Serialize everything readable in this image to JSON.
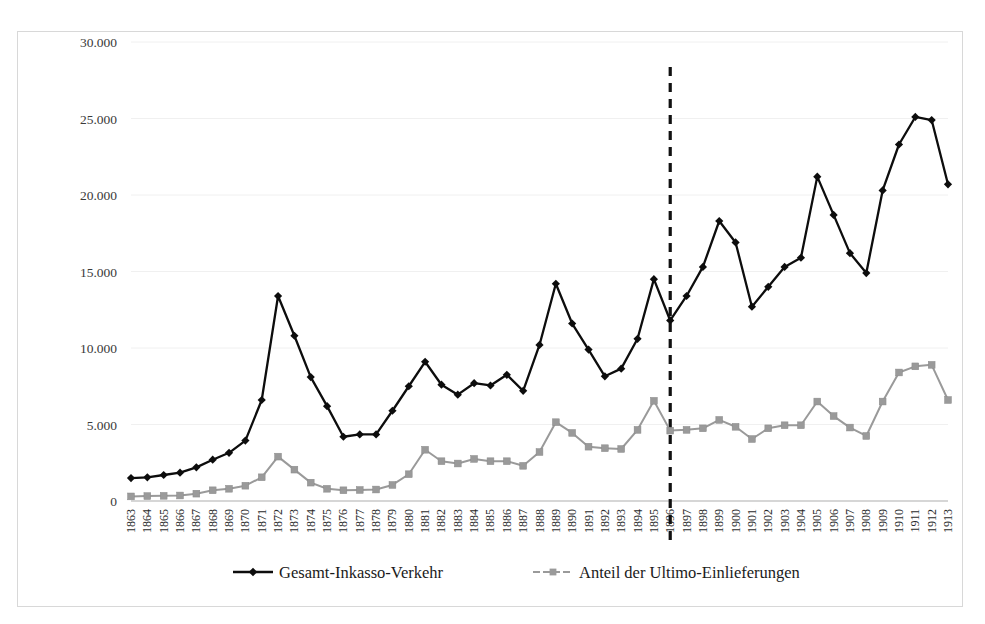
{
  "chart_data": {
    "type": "line",
    "title": "",
    "xlabel": "",
    "ylabel": "",
    "ylim": [
      0,
      30000
    ],
    "yticks": [
      0,
      5000,
      10000,
      15000,
      20000,
      25000,
      30000
    ],
    "ytick_labels": [
      "0",
      "5.000",
      "10.000",
      "15.000",
      "20.000",
      "25.000",
      "30.000"
    ],
    "grid": true,
    "legend_position": "bottom",
    "x": [
      1863,
      1864,
      1865,
      1866,
      1867,
      1868,
      1869,
      1870,
      1871,
      1872,
      1873,
      1874,
      1875,
      1876,
      1877,
      1878,
      1879,
      1880,
      1881,
      1882,
      1883,
      1884,
      1885,
      1886,
      1887,
      1888,
      1889,
      1890,
      1891,
      1892,
      1893,
      1894,
      1895,
      1896,
      1897,
      1898,
      1899,
      1900,
      1901,
      1902,
      1903,
      1904,
      1905,
      1906,
      1907,
      1908,
      1909,
      1910,
      1911,
      1912,
      1913
    ],
    "xtick_labels": [
      "1863",
      "1864",
      "1865",
      "1866",
      "1867",
      "1868",
      "1869",
      "1870",
      "1871",
      "1872",
      "1873",
      "1874",
      "1875",
      "1876",
      "1877",
      "1878",
      "1879",
      "1880",
      "1881",
      "1882",
      "1883",
      "1884",
      "1885",
      "1886",
      "1887",
      "1888",
      "1889",
      "1890",
      "1891",
      "1892",
      "1893",
      "1894",
      "1895",
      "1896",
      "1897",
      "1898",
      "1899",
      "1900",
      "1901",
      "1902",
      "1903",
      "1904",
      "1905",
      "1906",
      "1907",
      "1908",
      "1909",
      "1910",
      "1911",
      "1912",
      "1913"
    ],
    "series": [
      {
        "name": "Gesamt-Inkasso-Verkehr",
        "color": "#0d0d0d",
        "marker": "diamond",
        "values": [
          1500,
          1550,
          1700,
          1850,
          2200,
          2700,
          3150,
          3950,
          6600,
          13400,
          10800,
          8100,
          6200,
          4200,
          4350,
          4350,
          5900,
          7500,
          9100,
          7600,
          6950,
          7700,
          7550,
          8250,
          7200,
          10200,
          14200,
          11600,
          9900,
          8150,
          8650,
          10600,
          14500,
          11800,
          13400,
          15300,
          18300,
          16900,
          12700,
          14000,
          15300,
          15900,
          21200,
          18700,
          16200,
          14900,
          20300,
          23300,
          25100,
          24900,
          20700
        ]
      },
      {
        "name": "Anteil der Ultimo-Einlieferungen",
        "color": "#9a9a9a",
        "marker": "square",
        "values": [
          300,
          320,
          340,
          360,
          480,
          700,
          800,
          1000,
          1550,
          2900,
          2050,
          1200,
          800,
          700,
          720,
          750,
          1050,
          1750,
          3350,
          2600,
          2450,
          2750,
          2600,
          2600,
          2300,
          3200,
          5150,
          4450,
          3550,
          3450,
          3400,
          4650,
          6550,
          4600,
          4650,
          4750,
          5300,
          4850,
          4050,
          4750,
          4950,
          4950,
          6500,
          5550,
          4800,
          4250,
          6500,
          8400,
          8800,
          8900,
          6600
        ]
      }
    ],
    "annotations": [
      {
        "type": "vertical-dashed-line",
        "x": 1896,
        "label": ""
      }
    ]
  },
  "legend": {
    "entries": [
      {
        "label": "Gesamt-Inkasso-Verkehr",
        "color": "#0d0d0d",
        "marker": "diamond"
      },
      {
        "label": "Anteil der Ultimo-Einlieferungen",
        "color": "#9a9a9a",
        "marker": "square"
      }
    ]
  }
}
